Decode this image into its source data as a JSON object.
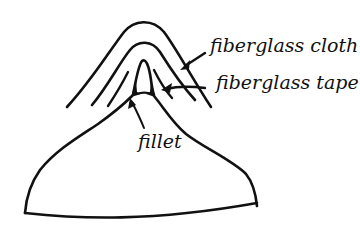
{
  "diagram": {
    "labels": {
      "cloth": "fiberglass cloth",
      "tape": "fiberglass tape",
      "fillet": "fillet"
    },
    "colors": {
      "ink": "#111111",
      "background": "#ffffff"
    }
  }
}
